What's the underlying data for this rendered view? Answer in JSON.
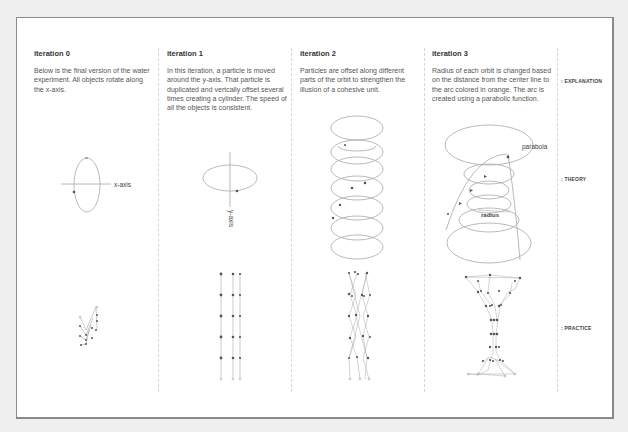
{
  "columns": [
    {
      "title": "iteration 0",
      "text": "Below is the final version of the water experiment. All objects rotate along the x-axis.",
      "theory_annotation": "x-axis"
    },
    {
      "title": "iteration 1",
      "text": "In this iteration, a particle is moved around the y-axis. That particle is duplicated and vertcally offset several times creating a cylinder. The speed of all the objects is consistent.",
      "theory_annotation": "y-axis"
    },
    {
      "title": "iteration 2",
      "text": "Particles are offset along different parts of the orbit to strengthen the illusion of a cohesive unit."
    },
    {
      "title": "iteration 3",
      "text": "Radius of each orbit is changed based on the distance from the center line to the arc colored in orange. The arc is created using a parabolic function.",
      "theory_annotations": [
        "parabola",
        "radius"
      ]
    }
  ],
  "row_labels": {
    "explanation": ": EXPLANATION",
    "theory": ": THEORY",
    "practice": ": PRACTICE"
  },
  "colors": {
    "background": "#efefef",
    "frame": "#ffffff",
    "frame_border": "#8a8a8a",
    "line": "#9a9a9a",
    "dot": "#555555"
  }
}
